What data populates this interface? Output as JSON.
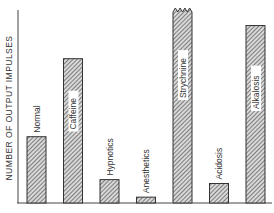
{
  "chart_data": {
    "type": "bar",
    "title": "",
    "xlabel": "",
    "ylabel": "NUMBER OF OUTPUT IMPULSES",
    "categories": [
      "Normal",
      "Caffeine",
      "Hypnotics",
      "Anesthetics",
      "Strychnine",
      "Acidosis",
      "Alkalosis"
    ],
    "values": [
      34,
      74,
      12,
      3,
      100,
      10,
      91
    ],
    "value_units": "relative (no numeric ticks shown; estimated as % of tallest bar)",
    "broken_bars": [
      "Strychnine"
    ],
    "label_inside_bar": [
      "Caffeine",
      "Strychnine",
      "Alkalosis"
    ],
    "ylim": [
      0,
      100
    ],
    "grid": false,
    "legend": null,
    "bar_fill": "diagonal hatch",
    "colors": {
      "bar_fill": "#9a9a9a",
      "bar_edge": "#333333",
      "axis": "#444444"
    }
  },
  "caption": "Figure ___. Effects of various agents on excitability (caption clipped)"
}
